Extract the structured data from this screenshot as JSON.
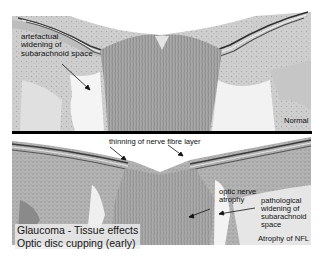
{
  "figure": {
    "title": "Glaucoma - Tissue effects",
    "subtitle": "Optic disc cupping (early)",
    "colors": {
      "background": "#ffffff",
      "tissue_light": "#d9d9d9",
      "tissue_mid": "#a8a8a8",
      "tissue_dark": "#6e6e6e",
      "separator": "#000000",
      "text": "#111111"
    }
  },
  "top_panel": {
    "condition_label": "Normal",
    "annotations": [
      {
        "lines": [
          "artefactual",
          "widening of",
          "subarachnoid space"
        ]
      }
    ]
  },
  "bottom_panel": {
    "annotations": [
      {
        "lines": [
          "thinning of nerve fibre layer"
        ]
      },
      {
        "lines": [
          "optic nerve",
          "atrophy"
        ]
      },
      {
        "lines": [
          "pathological",
          "widening of",
          "subarachnoid",
          "space"
        ]
      },
      {
        "lines": [
          "Atrophy of NFL"
        ]
      }
    ]
  }
}
